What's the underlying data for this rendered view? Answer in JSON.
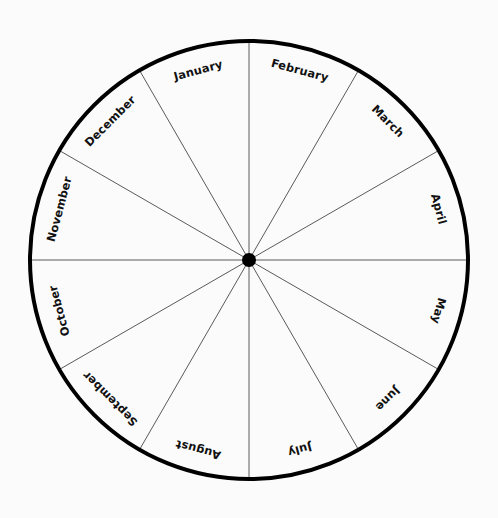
{
  "figure": {
    "type": "month-wheel",
    "title": "",
    "background_color": "#fbfbfb",
    "outer_circle_color": "#000000",
    "spoke_color": "#5a5a5a",
    "hub_color": "#000000",
    "label_color": "#111111",
    "center_x": 249,
    "center_y": 260,
    "radius": 219,
    "outer_stroke_width": 4,
    "spoke_stroke_width": 1,
    "hub_radius": 7,
    "sector_count": 12,
    "sector_angle_degrees": 30,
    "label_radius": 196,
    "first_sector_start_degrees": 0
  },
  "chart_data": {
    "type": "pie",
    "title": "",
    "xlabel": "",
    "ylabel": "",
    "legend_position": "none",
    "grid": false,
    "categories": [
      "February",
      "March",
      "April",
      "May",
      "June",
      "July",
      "August",
      "September",
      "October",
      "November",
      "December",
      "January"
    ],
    "values": [
      30,
      30,
      30,
      30,
      30,
      30,
      30,
      30,
      30,
      30,
      30,
      30
    ]
  },
  "sectors": [
    {
      "label": "February",
      "index": 0,
      "start_deg": 0,
      "mid_deg": 15,
      "end_deg": 30,
      "flip": false
    },
    {
      "label": "March",
      "index": 1,
      "start_deg": 30,
      "mid_deg": 45,
      "end_deg": 60,
      "flip": false
    },
    {
      "label": "April",
      "index": 2,
      "start_deg": 60,
      "mid_deg": 75,
      "end_deg": 90,
      "flip": false
    },
    {
      "label": "May",
      "index": 3,
      "start_deg": 90,
      "mid_deg": 105,
      "end_deg": 120,
      "flip": true
    },
    {
      "label": "June",
      "index": 4,
      "start_deg": 120,
      "mid_deg": 135,
      "end_deg": 150,
      "flip": true
    },
    {
      "label": "July",
      "index": 5,
      "start_deg": 150,
      "mid_deg": 165,
      "end_deg": 180,
      "flip": true
    },
    {
      "label": "August",
      "index": 6,
      "start_deg": 180,
      "mid_deg": 195,
      "end_deg": 210,
      "flip": true
    },
    {
      "label": "September",
      "index": 7,
      "start_deg": 210,
      "mid_deg": 225,
      "end_deg": 240,
      "flip": true
    },
    {
      "label": "October",
      "index": 8,
      "start_deg": 240,
      "mid_deg": 255,
      "end_deg": 270,
      "flip": true
    },
    {
      "label": "November",
      "index": 9,
      "start_deg": 270,
      "mid_deg": 285,
      "end_deg": 300,
      "flip": false
    },
    {
      "label": "December",
      "index": 10,
      "start_deg": 300,
      "mid_deg": 315,
      "end_deg": 330,
      "flip": false
    },
    {
      "label": "January",
      "index": 11,
      "start_deg": 330,
      "mid_deg": 345,
      "end_deg": 360,
      "flip": false
    }
  ]
}
